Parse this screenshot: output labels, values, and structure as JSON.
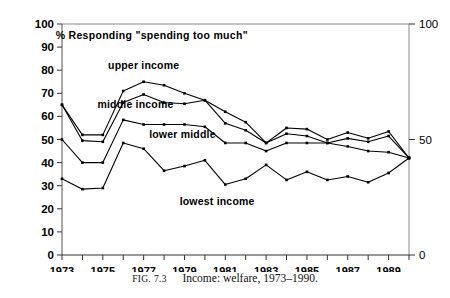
{
  "figure": {
    "caption_prefix": "FIG.",
    "caption_number": "7.3",
    "caption_text": "Income: welfare, 1973–1990."
  },
  "chart_data": {
    "type": "line",
    "title": "% Responding \"spending too much\"",
    "xlabel": "",
    "ylabel": "",
    "xlim": [
      1973,
      1990
    ],
    "ylim": [
      0,
      100
    ],
    "grid": false,
    "legend": "inline-annotations",
    "left_axis_ticks": [
      "0",
      "10",
      "20",
      "30",
      "40",
      "50",
      "60",
      "70",
      "80",
      "90",
      "100"
    ],
    "right_axis_ticks": [
      "0",
      "50",
      "100"
    ],
    "x_tick_labels": [
      "1973",
      "1975",
      "1977",
      "1979",
      "1981",
      "1983",
      "1985",
      "1987",
      "1989"
    ],
    "x": [
      1973,
      1974,
      1975,
      1976,
      1977,
      1978,
      1979,
      1980,
      1981,
      1982,
      1983,
      1984,
      1985,
      1986,
      1987,
      1988,
      1989,
      1990
    ],
    "series": [
      {
        "name": "upper income",
        "label": "upper income",
        "color": "#000000",
        "values": [
          65,
          52,
          52,
          71,
          75,
          73.5,
          70,
          67,
          62,
          57.5,
          48.5,
          55,
          54.5,
          50,
          53,
          50.5,
          53.5,
          42
        ]
      },
      {
        "name": "middle income",
        "label": "middle income",
        "color": "#000000",
        "values": [
          65,
          49.5,
          49,
          66,
          69.5,
          66,
          65.5,
          67,
          57,
          54,
          48.5,
          52.5,
          51.5,
          48.5,
          50.5,
          49,
          51.5,
          42
        ]
      },
      {
        "name": "lower middle",
        "label": "lower middle",
        "color": "#000000",
        "values": [
          50,
          40,
          40,
          58.5,
          56.5,
          56.5,
          56.5,
          55.5,
          48.5,
          48.5,
          45,
          48.5,
          48.5,
          48.5,
          47,
          45,
          44.5,
          42
        ]
      },
      {
        "name": "lowest income",
        "label": "lowest income",
        "color": "#000000",
        "values": [
          33,
          28.5,
          29,
          48.5,
          46,
          36.5,
          38.5,
          41,
          30.5,
          33,
          39,
          32.5,
          36,
          32.5,
          34,
          31.5,
          35.5,
          42
        ]
      }
    ],
    "annotations": [
      {
        "text": "upper income",
        "x": 1977.0,
        "y": 80.5
      },
      {
        "text": "middle income",
        "x": 1976.6,
        "y": 63.5
      },
      {
        "text": "lower middle",
        "x": 1978.9,
        "y": 50.5
      },
      {
        "text": "lowest income",
        "x": 1980.6,
        "y": 21.5
      }
    ]
  }
}
